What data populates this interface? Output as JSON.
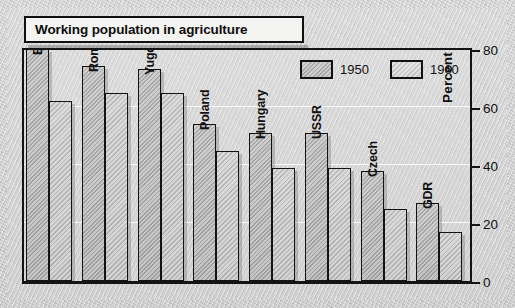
{
  "title": "Working population in agriculture",
  "axis": {
    "ylabel": "Percent",
    "ticks": [
      "80",
      "60",
      "40",
      "20",
      "0"
    ]
  },
  "legend": {
    "items": [
      {
        "label": "1950",
        "swatch": "hatched-dark-swatch"
      },
      {
        "label": "1960",
        "swatch": "hatched-light-swatch"
      }
    ]
  },
  "chart_data": {
    "type": "bar",
    "title": "Working population in agriculture",
    "xlabel": "",
    "ylabel": "Percent",
    "ylim": [
      0,
      80
    ],
    "yticks": [
      0,
      20,
      40,
      60,
      80
    ],
    "grid": true,
    "legend_position": "top-right",
    "categories": [
      "Bulgaria",
      "Romania",
      "Yugoslavia",
      "Poland",
      "Hungary",
      "USSR",
      "Czech",
      "GDR"
    ],
    "series": [
      {
        "name": "1950",
        "values": [
          80,
          74,
          73,
          54,
          51,
          51,
          38,
          27
        ]
      },
      {
        "name": "1960",
        "values": [
          62,
          65,
          65,
          45,
          39,
          39,
          25,
          17
        ]
      }
    ]
  }
}
